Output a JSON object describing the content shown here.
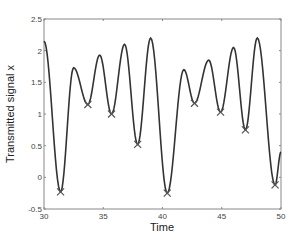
{
  "chart_data": {
    "type": "line",
    "title": "",
    "xlabel": "Time",
    "ylabel": "Transmitted signal x",
    "xlim": [
      30,
      50
    ],
    "ylim": [
      -0.5,
      2.5
    ],
    "xticks": [
      30,
      35,
      40,
      45,
      50
    ],
    "yticks": [
      -0.5,
      0,
      0.5,
      1,
      1.5,
      2,
      2.5
    ],
    "xtick_labels": [
      "30",
      "35",
      "40",
      "45",
      "50"
    ],
    "ytick_labels": [
      "-0.5",
      "0",
      "0.5",
      "1",
      "1.5",
      "2",
      "2.5"
    ],
    "grid": false,
    "legend": null,
    "series": [
      {
        "name": "signal",
        "color": "#333333",
        "style": "line",
        "x": [
          30.0,
          31.4,
          32.5,
          33.7,
          34.7,
          35.7,
          36.8,
          37.9,
          39.0,
          40.4,
          41.8,
          42.7,
          43.9,
          44.9,
          46.0,
          47.0,
          48.0,
          49.5,
          50.0
        ],
        "y": [
          2.15,
          -0.23,
          1.73,
          1.15,
          1.93,
          1.0,
          2.1,
          0.52,
          2.2,
          -0.25,
          1.7,
          1.17,
          1.85,
          1.03,
          2.05,
          0.75,
          2.2,
          -0.12,
          0.4
        ]
      },
      {
        "name": "minima",
        "color": "#555555",
        "style": "marker-x",
        "x": [
          31.4,
          33.7,
          35.7,
          37.9,
          40.4,
          42.7,
          44.9,
          47.0,
          49.5
        ],
        "y": [
          -0.23,
          1.15,
          1.0,
          0.52,
          -0.25,
          1.17,
          1.03,
          0.75,
          -0.12
        ]
      }
    ]
  }
}
